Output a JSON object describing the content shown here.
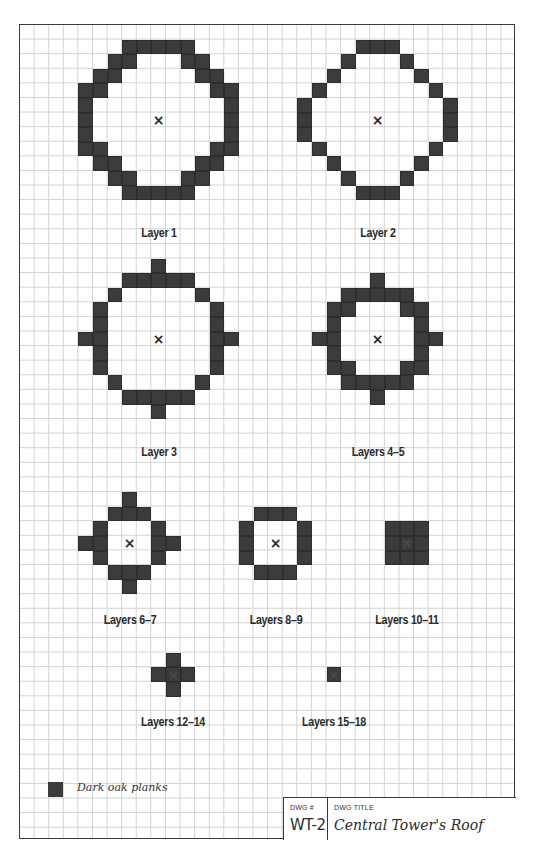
{
  "drawing": {
    "grid": {
      "cell_px": 14.6,
      "cols": 34,
      "rows": 56
    },
    "block_color": "#3b3b3b",
    "grid_line_color": "#d2d2d2",
    "frame_color": "#3a3a3a",
    "center_marker": "×",
    "layers": [
      {
        "label": "Layer 1",
        "center": [
          9,
          6
        ],
        "label_pos": [
          9,
          13.7
        ],
        "blocks": [
          [
            7,
            1
          ],
          [
            8,
            1
          ],
          [
            9,
            1
          ],
          [
            10,
            1
          ],
          [
            11,
            1
          ],
          [
            6,
            2
          ],
          [
            7,
            2
          ],
          [
            11,
            2
          ],
          [
            12,
            2
          ],
          [
            5,
            3
          ],
          [
            6,
            3
          ],
          [
            12,
            3
          ],
          [
            13,
            3
          ],
          [
            4,
            4
          ],
          [
            5,
            4
          ],
          [
            13,
            4
          ],
          [
            14,
            4
          ],
          [
            4,
            5
          ],
          [
            14,
            5
          ],
          [
            4,
            6
          ],
          [
            14,
            6
          ],
          [
            4,
            7
          ],
          [
            14,
            7
          ],
          [
            4,
            8
          ],
          [
            5,
            8
          ],
          [
            13,
            8
          ],
          [
            14,
            8
          ],
          [
            5,
            9
          ],
          [
            6,
            9
          ],
          [
            12,
            9
          ],
          [
            13,
            9
          ],
          [
            6,
            10
          ],
          [
            7,
            10
          ],
          [
            11,
            10
          ],
          [
            12,
            10
          ],
          [
            7,
            11
          ],
          [
            8,
            11
          ],
          [
            9,
            11
          ],
          [
            10,
            11
          ],
          [
            11,
            11
          ]
        ]
      },
      {
        "label": "Layer 2",
        "center": [
          24,
          6
        ],
        "label_pos": [
          24,
          13.7
        ],
        "blocks": [
          [
            23,
            1
          ],
          [
            24,
            1
          ],
          [
            25,
            1
          ],
          [
            22,
            2
          ],
          [
            26,
            2
          ],
          [
            21,
            3
          ],
          [
            27,
            3
          ],
          [
            20,
            4
          ],
          [
            28,
            4
          ],
          [
            19,
            5
          ],
          [
            29,
            5
          ],
          [
            19,
            6
          ],
          [
            29,
            6
          ],
          [
            19,
            7
          ],
          [
            29,
            7
          ],
          [
            20,
            8
          ],
          [
            28,
            8
          ],
          [
            21,
            9
          ],
          [
            27,
            9
          ],
          [
            22,
            10
          ],
          [
            26,
            10
          ],
          [
            23,
            11
          ],
          [
            24,
            11
          ],
          [
            25,
            11
          ]
        ]
      },
      {
        "label": "Layer 3",
        "center": [
          9,
          21
        ],
        "label_pos": [
          9,
          28.7
        ],
        "blocks": [
          [
            9,
            16
          ],
          [
            7,
            17
          ],
          [
            8,
            17
          ],
          [
            9,
            17
          ],
          [
            10,
            17
          ],
          [
            11,
            17
          ],
          [
            6,
            18
          ],
          [
            12,
            18
          ],
          [
            5,
            19
          ],
          [
            13,
            19
          ],
          [
            5,
            20
          ],
          [
            13,
            20
          ],
          [
            4,
            21
          ],
          [
            5,
            21
          ],
          [
            13,
            21
          ],
          [
            14,
            21
          ],
          [
            5,
            22
          ],
          [
            13,
            22
          ],
          [
            5,
            23
          ],
          [
            13,
            23
          ],
          [
            6,
            24
          ],
          [
            12,
            24
          ],
          [
            7,
            25
          ],
          [
            8,
            25
          ],
          [
            9,
            25
          ],
          [
            10,
            25
          ],
          [
            11,
            25
          ],
          [
            9,
            26
          ]
        ]
      },
      {
        "label": "Layers 4–5",
        "center": [
          24,
          21
        ],
        "label_pos": [
          24,
          28.7
        ],
        "blocks": [
          [
            24,
            17
          ],
          [
            22,
            18
          ],
          [
            23,
            18
          ],
          [
            24,
            18
          ],
          [
            25,
            18
          ],
          [
            26,
            18
          ],
          [
            21,
            19
          ],
          [
            22,
            19
          ],
          [
            26,
            19
          ],
          [
            27,
            19
          ],
          [
            21,
            20
          ],
          [
            27,
            20
          ],
          [
            20,
            21
          ],
          [
            21,
            21
          ],
          [
            27,
            21
          ],
          [
            28,
            21
          ],
          [
            21,
            22
          ],
          [
            27,
            22
          ],
          [
            21,
            23
          ],
          [
            22,
            23
          ],
          [
            26,
            23
          ],
          [
            27,
            23
          ],
          [
            22,
            24
          ],
          [
            23,
            24
          ],
          [
            24,
            24
          ],
          [
            25,
            24
          ],
          [
            26,
            24
          ],
          [
            24,
            25
          ]
        ]
      },
      {
        "label": "Layers 6–7",
        "center": [
          7,
          35
        ],
        "label_pos": [
          7,
          40.2
        ],
        "blocks": [
          [
            7,
            32
          ],
          [
            6,
            33
          ],
          [
            7,
            33
          ],
          [
            8,
            33
          ],
          [
            5,
            34
          ],
          [
            9,
            34
          ],
          [
            4,
            35
          ],
          [
            5,
            35
          ],
          [
            9,
            35
          ],
          [
            10,
            35
          ],
          [
            5,
            36
          ],
          [
            9,
            36
          ],
          [
            6,
            37
          ],
          [
            7,
            37
          ],
          [
            8,
            37
          ],
          [
            7,
            38
          ]
        ]
      },
      {
        "label": "Layers 8–9",
        "center": [
          17,
          35
        ],
        "label_pos": [
          17,
          40.2
        ],
        "blocks": [
          [
            16,
            33
          ],
          [
            17,
            33
          ],
          [
            18,
            33
          ],
          [
            15,
            34
          ],
          [
            19,
            34
          ],
          [
            15,
            35
          ],
          [
            19,
            35
          ],
          [
            15,
            36
          ],
          [
            19,
            36
          ],
          [
            16,
            37
          ],
          [
            17,
            37
          ],
          [
            18,
            37
          ]
        ]
      },
      {
        "label": "Layers 10–11",
        "center": [
          26,
          35
        ],
        "label_pos": [
          26,
          40.2
        ],
        "blocks": [
          [
            25,
            34
          ],
          [
            26,
            34
          ],
          [
            27,
            34
          ],
          [
            25,
            35
          ],
          [
            26,
            35
          ],
          [
            27,
            35
          ],
          [
            25,
            36
          ],
          [
            26,
            36
          ],
          [
            27,
            36
          ]
        ]
      },
      {
        "label": "Layers 12–14",
        "center": [
          10,
          44
        ],
        "label_pos": [
          10,
          47.2
        ],
        "blocks": [
          [
            10,
            43
          ],
          [
            9,
            44
          ],
          [
            10,
            44
          ],
          [
            11,
            44
          ],
          [
            10,
            45
          ]
        ]
      },
      {
        "label": "Layers 15–18",
        "center": [
          21,
          44
        ],
        "label_pos": [
          21,
          47.2
        ],
        "blocks": [
          [
            21,
            44
          ]
        ]
      }
    ]
  },
  "legend": {
    "items": [
      {
        "swatch_color": "#3b3b3b",
        "label": "Dark oak planks"
      }
    ]
  },
  "title_block": {
    "dwg_num_heading": "DWG #",
    "dwg_num": "WT-2",
    "dwg_title_heading": "DWG TITLE",
    "dwg_title": "Central Tower's Roof"
  }
}
